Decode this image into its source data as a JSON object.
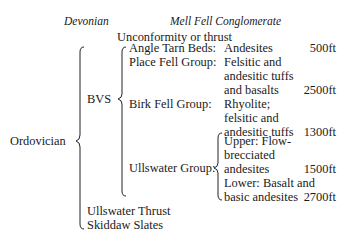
{
  "header": {
    "left": "Devonian",
    "right": "Mell Fell Conglomerate"
  },
  "unconformity": "Unconformity or thrust",
  "period": "Ordovician",
  "group_label": "BVS",
  "units": [
    {
      "name": "Angle Tarn Beds:",
      "lithology": [
        "Andesites"
      ],
      "thickness": "500ft"
    },
    {
      "name": "Place Fell Group:",
      "lithology": [
        "Felsitic and",
        "andesitic tuffs",
        "and basalts"
      ],
      "thickness": "2500ft"
    },
    {
      "name": "Birk Fell Group:",
      "lithology": [
        "Rhyolite;",
        "felsitic and",
        "andesitic tuffs"
      ],
      "thickness": "1300ft"
    },
    {
      "name": "Ullswater Group:",
      "subunits": [
        {
          "lithology": [
            "Upper: Flow-",
            "brecciated",
            "andesites"
          ],
          "thickness": "1500ft"
        },
        {
          "lithology": [
            "Lower: Basalt and",
            "basic andesites"
          ],
          "thickness": "2700ft"
        }
      ]
    }
  ],
  "footer": {
    "thrust": "Ullswater Thrust",
    "base": "Skiddaw Slates"
  }
}
